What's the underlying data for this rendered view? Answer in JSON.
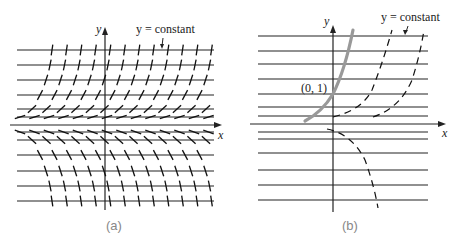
{
  "panels": [
    {
      "id": "a",
      "caption": "(a)",
      "x_axis_label": "x",
      "y_axis_label": "y",
      "annotation": "y = constant",
      "description": "Direction field: slopes are steep at large |y|, shallow near y=0 just above x-axis, negative below x-axis"
    },
    {
      "id": "b",
      "caption": "(b)",
      "x_axis_label": "x",
      "y_axis_label": "y",
      "annotation": "y = constant",
      "point_label": "(0, 1)",
      "description": "Solution curves (dashed) crossing horizontal isoclines; highlighted solution through (0, 1)"
    }
  ]
}
